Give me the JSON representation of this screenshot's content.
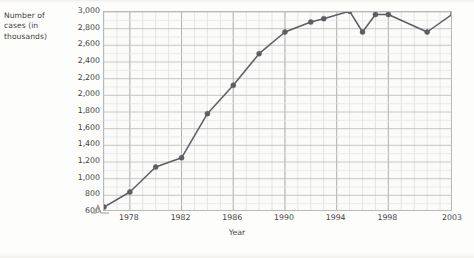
{
  "chart_data": {
    "type": "line",
    "title": "",
    "xlabel": "Year",
    "ylabel": "Number of cases (in thousands)",
    "ylabel_lines": [
      "Number of",
      "cases (in",
      "thousands)"
    ],
    "xlim": [
      1976,
      2003
    ],
    "ylim": [
      600,
      3000
    ],
    "y_tick_labels": [
      "3,000",
      "2,800",
      "2,600",
      "2,400",
      "2,200",
      "2,000",
      "1,800",
      "1,600",
      "1,400",
      "1,200",
      "1,000",
      "800",
      "600"
    ],
    "y_tick_values": [
      3000,
      2800,
      2600,
      2400,
      2200,
      2000,
      1800,
      1600,
      1400,
      1200,
      1000,
      800,
      600
    ],
    "x_tick_labels": [
      "1978",
      "1982",
      "1986",
      "1990",
      "1994",
      "1998",
      "2003"
    ],
    "x_tick_values": [
      1978,
      1982,
      1986,
      1990,
      1994,
      1998,
      2003
    ],
    "grid": true,
    "grid_minor": true,
    "legend": "none",
    "y_axis_break": true,
    "series": [
      {
        "name": "Number of cases",
        "color": "#5d5d63",
        "marker": "circle",
        "x": [
          1976,
          1978,
          1980,
          1982,
          1984,
          1986,
          1988,
          1990,
          1992,
          1993,
          1995,
          1996,
          1997,
          1998,
          2001,
          2003
        ],
        "values": [
          660,
          840,
          1140,
          1250,
          1780,
          2120,
          2500,
          2760,
          2880,
          2920,
          3010,
          2760,
          2970,
          2970,
          2760,
          2980
        ]
      }
    ]
  },
  "axis": {
    "break_symbol": "zigzag-break"
  }
}
